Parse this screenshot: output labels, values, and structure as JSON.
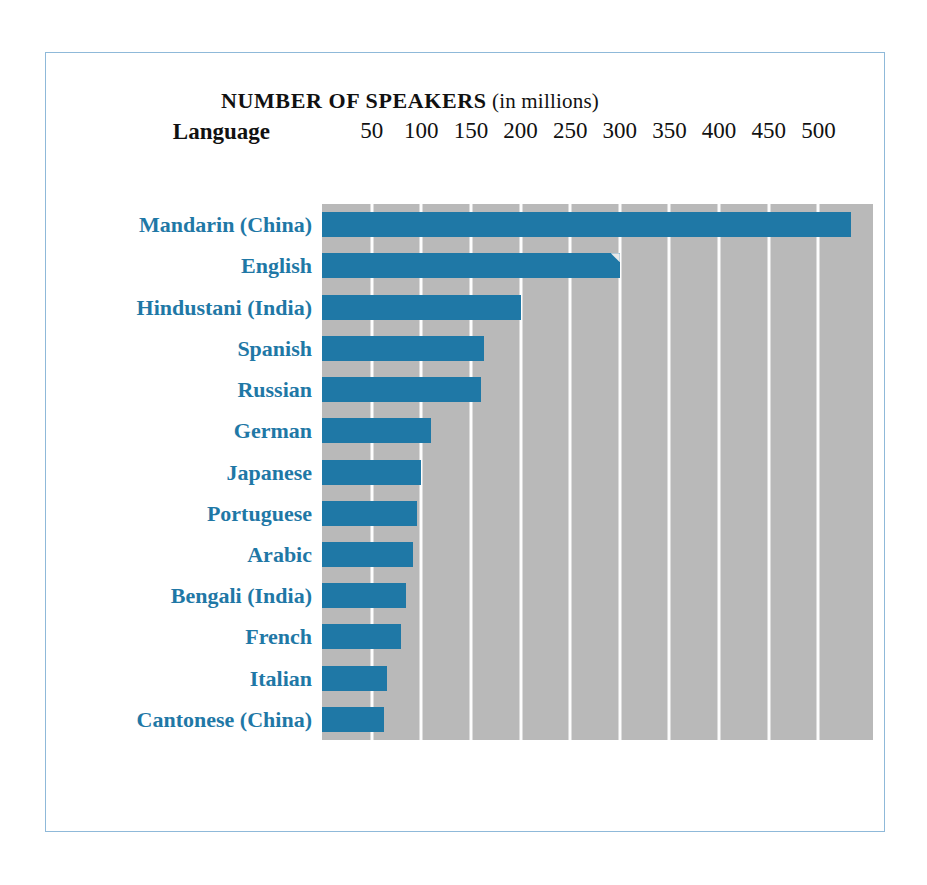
{
  "figure": {
    "title_main": "NUMBER OF SPEAKERS",
    "title_paren": "(in millions)",
    "axis_label": "Language",
    "accent_color": "#1f78a6",
    "plot_background_color": "#b9b9b9",
    "gridline_color": "#fdfdfd",
    "frame_color": "#8fb9d9"
  },
  "chart_data": {
    "type": "bar",
    "orientation": "horizontal",
    "title": "NUMBER OF SPEAKERS (in millions)",
    "xlabel": "Number of speakers (in millions)",
    "ylabel": "Language",
    "xlim": [
      0,
      555
    ],
    "xticks": [
      50,
      100,
      150,
      200,
      250,
      300,
      350,
      400,
      450,
      500
    ],
    "tick_labels": [
      "50",
      "100",
      "150",
      "200",
      "250",
      "300",
      "350",
      "400",
      "450",
      "500"
    ],
    "grid": true,
    "legend": "none",
    "categories": [
      "Mandarin (China)",
      "English",
      "Hindustani (India)",
      "Spanish",
      "Russian",
      "German",
      "Japanese",
      "Portuguese",
      "Arabic",
      "Bengali (India)",
      "French",
      "Italian",
      "Cantonese (China)"
    ],
    "values": [
      533,
      300,
      200,
      163,
      160,
      110,
      100,
      96,
      92,
      85,
      80,
      65,
      62
    ],
    "series": [
      {
        "name": "Number of speakers",
        "values": [
          533,
          300,
          200,
          163,
          160,
          110,
          100,
          96,
          92,
          85,
          80,
          65,
          62
        ]
      }
    ]
  }
}
